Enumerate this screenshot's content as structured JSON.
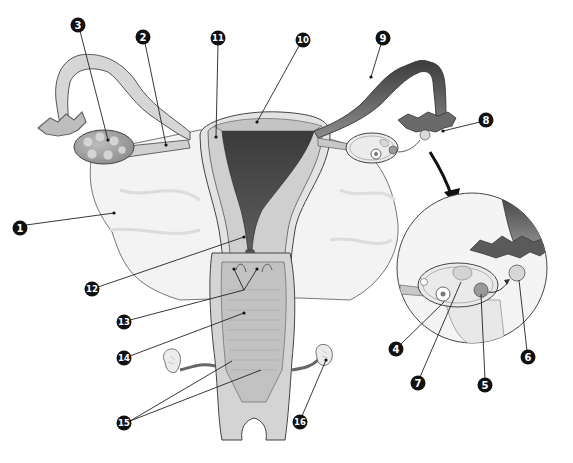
{
  "diagram": {
    "colors": {
      "background": "#ffffff",
      "tissue_light": "#e6e6e6",
      "tissue_mid": "#c8c8c8",
      "tissue_dark": "#4a4a4a",
      "broad_ligament": "#f2f2f2",
      "outline": "#3a3a3a",
      "label_badge": "#111111",
      "label_text": "#ffffff",
      "leader_line": "#222222"
    },
    "labels": [
      {
        "id": "1",
        "text": "1",
        "x": 20,
        "y": 228,
        "target_x": 114,
        "target_y": 213
      },
      {
        "id": "2",
        "text": "2",
        "x": 143,
        "y": 37,
        "target_x": 166,
        "target_y": 145
      },
      {
        "id": "3",
        "text": "3",
        "x": 78,
        "y": 25,
        "target_x": 108,
        "target_y": 140
      },
      {
        "id": "4",
        "text": "4",
        "x": 396,
        "y": 349,
        "target_x": 444,
        "target_y": 302
      },
      {
        "id": "5",
        "text": "5",
        "x": 485,
        "y": 385,
        "target_x": 481,
        "target_y": 294
      },
      {
        "id": "6",
        "text": "6",
        "x": 528,
        "y": 357,
        "target_x": 519,
        "target_y": 272
      },
      {
        "id": "7",
        "text": "7",
        "x": 418,
        "y": 383,
        "target_x": 461,
        "target_y": 282
      },
      {
        "id": "8",
        "text": "8",
        "x": 486,
        "y": 120,
        "target_x": 443,
        "target_y": 131
      },
      {
        "id": "9",
        "text": "9",
        "x": 383,
        "y": 38,
        "target_x": 371,
        "target_y": 77
      },
      {
        "id": "10",
        "text": "10",
        "x": 303,
        "y": 40,
        "target_x": 257,
        "target_y": 122
      },
      {
        "id": "11",
        "text": "11",
        "x": 218,
        "y": 38,
        "target_x": 216,
        "target_y": 137
      },
      {
        "id": "12",
        "text": "12",
        "x": 92,
        "y": 289,
        "target_x": 244,
        "target_y": 237
      },
      {
        "id": "13",
        "text": "13",
        "x": 124,
        "y": 322,
        "target_x": 244,
        "target_y": 288
      },
      {
        "id": "14",
        "text": "14",
        "x": 124,
        "y": 358,
        "target_x": 244,
        "target_y": 313
      },
      {
        "id": "15",
        "text": "15",
        "x": 124,
        "y": 423,
        "targets": [
          [
            232,
            361
          ],
          [
            261,
            370
          ]
        ]
      },
      {
        "id": "16",
        "text": "16",
        "x": 300,
        "y": 422,
        "target_x": 326,
        "target_y": 360
      }
    ],
    "inset": {
      "center_x": 472,
      "center_y": 268,
      "radius": 75,
      "arrow_from": [
        430,
        152
      ],
      "arrow_to": [
        455,
        203
      ]
    }
  }
}
